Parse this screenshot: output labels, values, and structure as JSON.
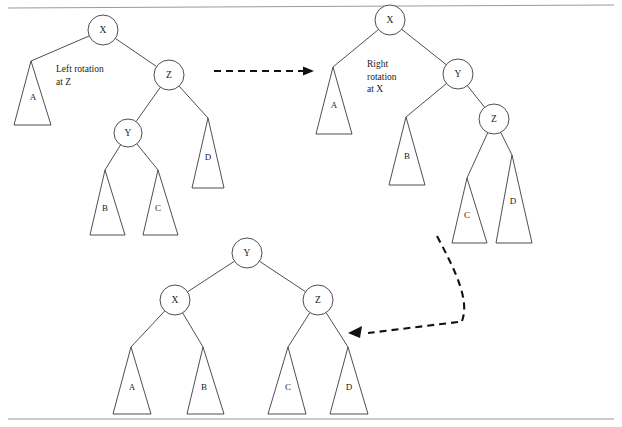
{
  "page": {
    "background_color": "#ffffff",
    "line_color": "#3a3a42",
    "text_color": "#1c1c20",
    "rule_color": "#9a9aa0",
    "width": 622,
    "height": 427
  },
  "rules": [
    {
      "name": "top-rule",
      "x1": 8,
      "y1": 8,
      "x2": 614,
      "y2": 5
    },
    {
      "name": "bottom-rule",
      "x1": 8,
      "y1": 419,
      "x2": 614,
      "y2": 419
    }
  ],
  "captions": [
    {
      "id": "left-rotation-caption",
      "lines": [
        "Left rotation",
        "at Z"
      ],
      "x": 56,
      "y": 72
    },
    {
      "id": "right-rotation-caption",
      "lines": [
        "Right",
        "rotation",
        "at X"
      ],
      "x": 367,
      "y": 67
    }
  ],
  "trees": [
    {
      "id": "tree-before",
      "name": "tree-before-rotation",
      "nodes": [
        {
          "id": "x",
          "label": "X",
          "cx": 103,
          "cy": 30,
          "r": 15
        },
        {
          "id": "z",
          "label": "Z",
          "cx": 169,
          "cy": 75,
          "r": 15
        },
        {
          "id": "y",
          "label": "Y",
          "cx": 128,
          "cy": 133,
          "r": 14
        }
      ],
      "subtrees": [
        {
          "id": "a",
          "label": "A",
          "apex_x": 31,
          "apex_y": 61,
          "base_y": 125,
          "base_left": 14,
          "base_right": 51,
          "label_x": 33,
          "label_y": 98
        },
        {
          "id": "d",
          "label": "D",
          "apex_x": 208,
          "apex_y": 118,
          "base_y": 188,
          "base_left": 192,
          "base_right": 224,
          "label_x": 208,
          "label_y": 158
        },
        {
          "id": "b",
          "label": "B",
          "apex_x": 105,
          "apex_y": 170,
          "base_y": 235,
          "base_left": 90,
          "base_right": 125,
          "label_x": 105,
          "label_y": 209
        },
        {
          "id": "c",
          "label": "C",
          "apex_x": 158,
          "apex_y": 170,
          "base_y": 235,
          "base_left": 143,
          "base_right": 178,
          "label_x": 158,
          "label_y": 209
        }
      ],
      "edges": [
        {
          "from": "x",
          "to": "a"
        },
        {
          "from": "x",
          "to": "z"
        },
        {
          "from": "z",
          "to": "y"
        },
        {
          "from": "z",
          "to": "d"
        },
        {
          "from": "y",
          "to": "b"
        },
        {
          "from": "y",
          "to": "c"
        }
      ]
    },
    {
      "id": "tree-middle",
      "name": "tree-after-left-rotation",
      "nodes": [
        {
          "id": "x",
          "label": "X",
          "cx": 390,
          "cy": 20,
          "r": 15
        },
        {
          "id": "y",
          "label": "Y",
          "cx": 458,
          "cy": 74,
          "r": 15
        },
        {
          "id": "z",
          "label": "Z",
          "cx": 494,
          "cy": 119,
          "r": 15
        }
      ],
      "subtrees": [
        {
          "id": "a",
          "label": "A",
          "apex_x": 333,
          "apex_y": 67,
          "base_y": 134,
          "base_left": 316,
          "base_right": 352,
          "label_x": 334,
          "label_y": 106
        },
        {
          "id": "b",
          "label": "B",
          "apex_x": 406,
          "apex_y": 117,
          "base_y": 185,
          "base_left": 389,
          "base_right": 425,
          "label_x": 407,
          "label_y": 157
        },
        {
          "id": "c",
          "label": "C",
          "apex_x": 467,
          "apex_y": 178,
          "base_y": 243,
          "base_left": 452,
          "base_right": 487,
          "label_x": 467,
          "label_y": 216
        },
        {
          "id": "d",
          "label": "D",
          "apex_x": 512,
          "apex_y": 155,
          "base_y": 243,
          "base_left": 496,
          "base_right": 532,
          "label_x": 513,
          "label_y": 202
        }
      ],
      "edges": [
        {
          "from": "x",
          "to": "a"
        },
        {
          "from": "x",
          "to": "y"
        },
        {
          "from": "y",
          "to": "b"
        },
        {
          "from": "y",
          "to": "z"
        },
        {
          "from": "z",
          "to": "c"
        },
        {
          "from": "z",
          "to": "d"
        }
      ]
    },
    {
      "id": "tree-final",
      "name": "tree-after-right-rotation",
      "nodes": [
        {
          "id": "y",
          "label": "Y",
          "cx": 247,
          "cy": 253,
          "r": 15
        },
        {
          "id": "x",
          "label": "X",
          "cx": 175,
          "cy": 300,
          "r": 15
        },
        {
          "id": "z",
          "label": "Z",
          "cx": 318,
          "cy": 300,
          "r": 15
        }
      ],
      "subtrees": [
        {
          "id": "a",
          "label": "A",
          "apex_x": 131,
          "apex_y": 347,
          "base_y": 414,
          "base_left": 113,
          "base_right": 151,
          "label_x": 132,
          "label_y": 388
        },
        {
          "id": "b",
          "label": "B",
          "apex_x": 203,
          "apex_y": 347,
          "base_y": 414,
          "base_left": 187,
          "base_right": 224,
          "label_x": 204,
          "label_y": 388
        },
        {
          "id": "c",
          "label": "C",
          "apex_x": 288,
          "apex_y": 347,
          "base_y": 414,
          "base_left": 268,
          "base_right": 306,
          "label_x": 288,
          "label_y": 388
        },
        {
          "id": "d",
          "label": "D",
          "apex_x": 348,
          "apex_y": 347,
          "base_y": 414,
          "base_left": 330,
          "base_right": 368,
          "label_x": 349,
          "label_y": 388
        }
      ],
      "edges": [
        {
          "from": "y",
          "to": "x"
        },
        {
          "from": "y",
          "to": "z"
        },
        {
          "from": "x",
          "to": "a"
        },
        {
          "from": "x",
          "to": "b"
        },
        {
          "from": "z",
          "to": "c"
        },
        {
          "from": "z",
          "to": "d"
        }
      ]
    }
  ],
  "arrows": [
    {
      "id": "arrow-left-to-middle",
      "name": "arrow-left-rotation",
      "path": "M 214 71 L 308 71",
      "head": "314,71 303,66.5 303,75.5"
    },
    {
      "id": "arrow-middle-to-bottom",
      "name": "arrow-right-rotation",
      "path": "M 437 236 C 455 270 470 300 462 321",
      "head": "348,333 362,326 360,338"
    }
  ],
  "arrow_curve_tail": "M 458 322 L 368 333"
}
